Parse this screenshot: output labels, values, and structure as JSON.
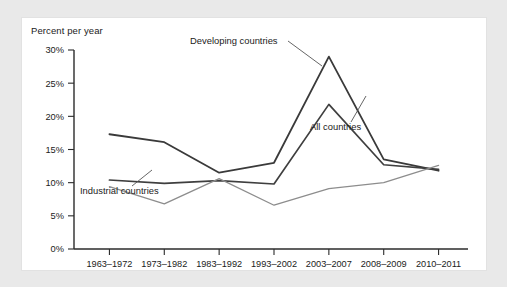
{
  "card": {
    "title": "Percent per year"
  },
  "chart_data": {
    "type": "line",
    "title": "Percent per year",
    "xlabel": "",
    "ylabel": "Percent per year",
    "ylim": [
      0,
      30
    ],
    "ytick_labels": [
      "0%",
      "5%",
      "10%",
      "15%",
      "20%",
      "25%",
      "30%"
    ],
    "ytick_values": [
      0,
      5,
      10,
      15,
      20,
      25,
      30
    ],
    "grid": false,
    "legend": "inline-annotations",
    "categories": [
      "1963–1972",
      "1973–1982",
      "1983–1992",
      "1993–2002",
      "2003–2007",
      "2008–2009",
      "2010–2011"
    ],
    "series": [
      {
        "name": "Developing countries",
        "color": "#3a3a3a",
        "values": [
          17.3,
          16.1,
          11.5,
          13.0,
          29.0,
          13.5,
          11.8
        ]
      },
      {
        "name": "All countries",
        "color": "#3f3f3f",
        "values": [
          10.4,
          9.9,
          10.3,
          9.8,
          21.8,
          12.7,
          12.0
        ]
      },
      {
        "name": "Industrial countries",
        "color": "#8d8d8d",
        "values": [
          9.4,
          6.8,
          10.6,
          6.6,
          9.1,
          10.0,
          12.6
        ]
      }
    ],
    "annotations": [
      {
        "text": "Developing countries",
        "series": "Developing countries"
      },
      {
        "text": "All countries",
        "series": "All countries"
      },
      {
        "text": "Industrial countries",
        "series": "Industrial countries"
      }
    ]
  }
}
